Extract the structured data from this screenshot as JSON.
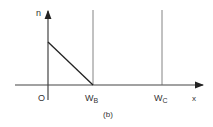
{
  "figure": {
    "caption": "(b)",
    "y_axis_label": "n",
    "x_axis_label": "x",
    "origin_label": "O",
    "markers": [
      {
        "name": "W",
        "sub": "B"
      },
      {
        "name": "W",
        "sub": "C"
      }
    ],
    "colors": {
      "line": "#222222",
      "thin_line": "#555555",
      "text": "#333333"
    }
  }
}
